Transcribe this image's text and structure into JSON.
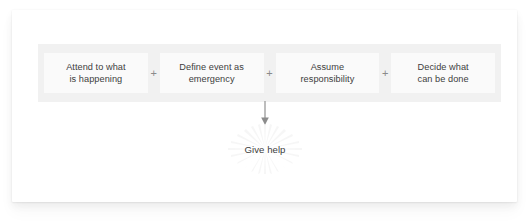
{
  "diagram": {
    "band": {
      "background_color": "#f1f1f1",
      "stage_background_color": "#fafafa",
      "operator": "+",
      "stages": [
        {
          "label": "Attend to what\nis happening"
        },
        {
          "label": "Define event as\nemergency"
        },
        {
          "label": "Assume\nresponsibility"
        },
        {
          "label": "Decide what\ncan be done"
        }
      ]
    },
    "connector": {
      "kind": "down-arrow",
      "color": "#8c8c8c"
    },
    "outcome": {
      "label": "Give help",
      "text_color": "#3d3d3d",
      "starburst_color": "#f2f2f2"
    }
  }
}
